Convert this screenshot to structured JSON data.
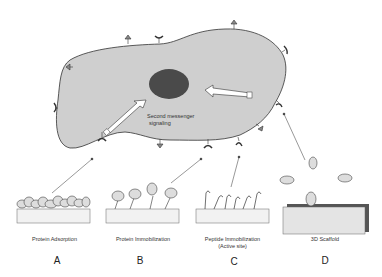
{
  "cell": {
    "signal_label_line1": "Second messenger",
    "signal_label_line2": "signaling",
    "fill": "#cfcfcf",
    "nucleus_fill": "#4a4a4a"
  },
  "panels": [
    {
      "letter": "A",
      "caption": "Protein Adsorption",
      "caption2": ""
    },
    {
      "letter": "B",
      "caption": "Protein Immobilization",
      "caption2": ""
    },
    {
      "letter": "C",
      "caption": "Peptide Immobilization",
      "caption2": "(Active site)"
    },
    {
      "letter": "D",
      "caption": "3D Scaffold",
      "caption2": ""
    }
  ]
}
